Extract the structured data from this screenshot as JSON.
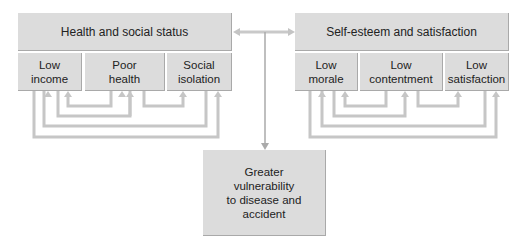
{
  "left_group": {
    "title": "Health and social status",
    "items": [
      {
        "line1": "Low",
        "line2": "income"
      },
      {
        "line1": "Poor",
        "line2": "health"
      },
      {
        "line1": "Social",
        "line2": "isolation"
      }
    ]
  },
  "right_group": {
    "title": "Self-esteem and satisfaction",
    "items": [
      {
        "line1": "Low",
        "line2": "morale"
      },
      {
        "line1": "Low",
        "line2": "contentment"
      },
      {
        "line1": "Low",
        "line2": "satisfaction"
      }
    ]
  },
  "outcome": {
    "lines": [
      "Greater",
      "vulnerability",
      "to disease and",
      "accident"
    ]
  },
  "colors": {
    "box_fill": "#dcdcdc",
    "connector": "#c8c8c8"
  }
}
